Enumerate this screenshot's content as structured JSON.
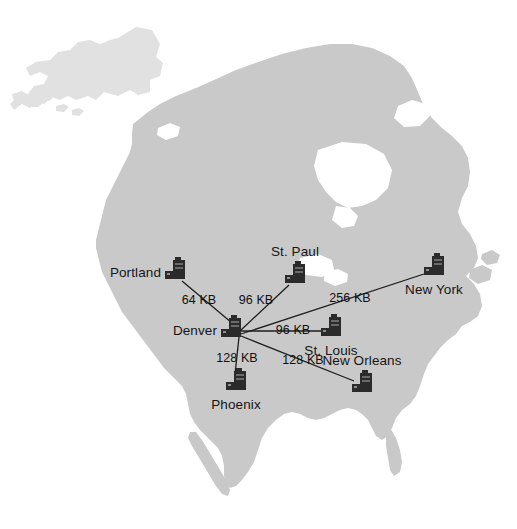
{
  "diagram": {
    "background_color": "#ffffff",
    "land_color": "#c9c9c9",
    "land_arctic_color": "#e1e1e1",
    "line_color": "#1d1d1d",
    "hub": "Denver"
  },
  "nodes": [
    {
      "id": "portland",
      "label": "Portland",
      "icon": "server-icon",
      "x": 175,
      "y": 272,
      "label_pos": "left"
    },
    {
      "id": "stpaul",
      "label": "St. Paul",
      "icon": "server-icon",
      "x": 295,
      "y": 276,
      "label_pos": "above"
    },
    {
      "id": "newyork",
      "label": "New York",
      "icon": "server-icon",
      "x": 434,
      "y": 268,
      "label_pos": "below"
    },
    {
      "id": "denver",
      "label": "Denver",
      "icon": "server-icon",
      "x": 231,
      "y": 330,
      "label_pos": "left"
    },
    {
      "id": "stlouis",
      "label": "St. Louis",
      "icon": "server-icon",
      "x": 331,
      "y": 329,
      "label_pos": "below"
    },
    {
      "id": "phoenix",
      "label": "Phoenix",
      "icon": "server-icon",
      "x": 236,
      "y": 383,
      "label_pos": "below"
    },
    {
      "id": "neworleans",
      "label": "New Orleans",
      "icon": "server-icon",
      "x": 362,
      "y": 385,
      "label_pos": "above"
    }
  ],
  "links": [
    {
      "from": "portland",
      "to": "denver",
      "bandwidth": "64 KB",
      "label_x": 199,
      "label_y": 300
    },
    {
      "from": "stpaul",
      "to": "denver",
      "bandwidth": "96 KB",
      "label_x": 256,
      "label_y": 300
    },
    {
      "from": "newyork",
      "to": "denver",
      "bandwidth": "256 KB",
      "label_x": 350,
      "label_y": 298
    },
    {
      "from": "stlouis",
      "to": "denver",
      "bandwidth": "96 KB",
      "label_x": 293,
      "label_y": 330
    },
    {
      "from": "phoenix",
      "to": "denver",
      "bandwidth": "128 KB",
      "label_x": 237,
      "label_y": 358
    },
    {
      "from": "neworleans",
      "to": "denver",
      "bandwidth": "128 KB",
      "label_x": 303,
      "label_y": 360
    }
  ]
}
